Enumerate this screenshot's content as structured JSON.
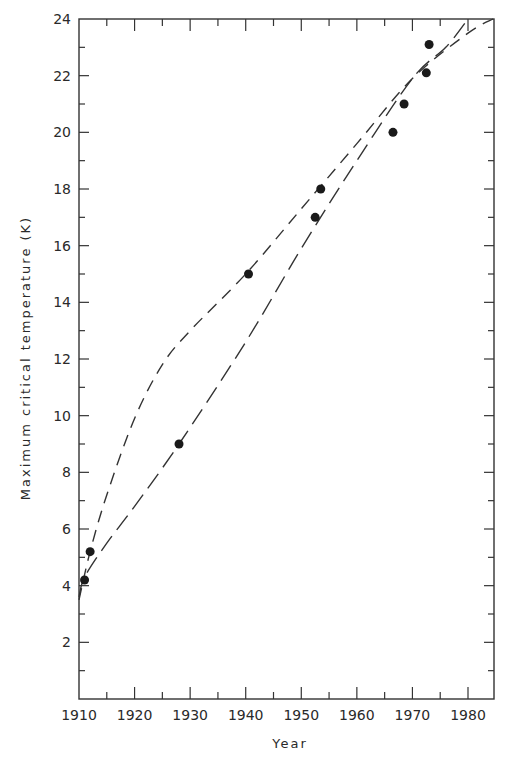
{
  "chart_data": {
    "type": "scatter",
    "title": "",
    "xlabel": "Year",
    "ylabel": "Maximum critical temperature (K)",
    "xlim": [
      1910,
      1984.5
    ],
    "ylim": [
      0,
      24
    ],
    "x_ticks": [
      1910,
      1920,
      1930,
      1940,
      1950,
      1960,
      1970,
      1980
    ],
    "x_tick_labels": [
      "1910",
      "1920",
      "1930",
      "1940",
      "1950",
      "1960",
      "1970",
      "1980"
    ],
    "y_ticks": [
      2,
      4,
      6,
      8,
      10,
      12,
      14,
      16,
      18,
      20,
      22,
      24
    ],
    "y_tick_labels": [
      "2",
      "4",
      "6",
      "8",
      "10",
      "12",
      "14",
      "16",
      "18",
      "20",
      "22",
      "24"
    ],
    "grid": false,
    "legend": null,
    "series": [
      {
        "name": "Record critical temperatures",
        "style": "points",
        "points": [
          {
            "x": 1911.0,
            "y": 4.2
          },
          {
            "x": 1912.0,
            "y": 5.2
          },
          {
            "x": 1928.0,
            "y": 9.0
          },
          {
            "x": 1940.5,
            "y": 15.0
          },
          {
            "x": 1952.5,
            "y": 17.0
          },
          {
            "x": 1953.5,
            "y": 18.0
          },
          {
            "x": 1966.5,
            "y": 20.0
          },
          {
            "x": 1968.5,
            "y": 21.0
          },
          {
            "x": 1972.5,
            "y": 22.1
          },
          {
            "x": 1973.0,
            "y": 23.1
          }
        ]
      },
      {
        "name": "Upper dashed trend curve (concave)",
        "style": "short-dash",
        "points": [
          {
            "x": 1910.0,
            "y": 3.5
          },
          {
            "x": 1912.0,
            "y": 5.2
          },
          {
            "x": 1915.0,
            "y": 7.2
          },
          {
            "x": 1920.0,
            "y": 9.9
          },
          {
            "x": 1925.0,
            "y": 11.8
          },
          {
            "x": 1930.0,
            "y": 13.0
          },
          {
            "x": 1940.0,
            "y": 15.0
          },
          {
            "x": 1950.0,
            "y": 17.3
          },
          {
            "x": 1960.0,
            "y": 19.6
          },
          {
            "x": 1970.0,
            "y": 21.9
          },
          {
            "x": 1980.0,
            "y": 23.5
          },
          {
            "x": 1984.5,
            "y": 24.0
          }
        ]
      },
      {
        "name": "Lower dashed trend curve (steeper)",
        "style": "long-dash",
        "points": [
          {
            "x": 1910.0,
            "y": 3.6
          },
          {
            "x": 1911.0,
            "y": 4.3
          },
          {
            "x": 1915.0,
            "y": 5.5
          },
          {
            "x": 1920.0,
            "y": 6.8
          },
          {
            "x": 1928.0,
            "y": 9.0
          },
          {
            "x": 1940.0,
            "y": 12.6
          },
          {
            "x": 1950.0,
            "y": 15.9
          },
          {
            "x": 1960.0,
            "y": 19.0
          },
          {
            "x": 1970.0,
            "y": 21.9
          },
          {
            "x": 1976.0,
            "y": 23.0
          },
          {
            "x": 1980.0,
            "y": 24.0
          }
        ]
      }
    ]
  },
  "axes": {
    "x_title": "Year",
    "y_title": "Maximum critical temperature (K)"
  }
}
